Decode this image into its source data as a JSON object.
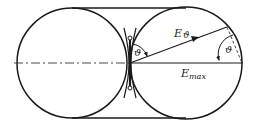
{
  "diagram": {
    "type": "two-tangent-circles-with-belt",
    "labels": {
      "e_theta": "E",
      "e_theta_sub": "ϑ",
      "e_max": "E",
      "e_max_sub": "max",
      "angle_left": "ϑ",
      "angle_right": "ϑ"
    },
    "colors": {
      "stroke": "#1a1a1a",
      "background": "#ffffff"
    }
  }
}
